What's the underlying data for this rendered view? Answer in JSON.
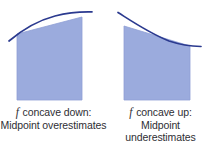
{
  "figure": {
    "background_color": "#ffffff",
    "fill_color": "#9babdd",
    "fill_edge_color": "#8fa0d6",
    "curve_color": "#2b3a8f",
    "text_color": "#2e2e33",
    "panels": [
      {
        "id": "concave-down",
        "caption_symbol": "f",
        "caption_line1": "concave down:",
        "caption_line2": "Midpoint overestimates",
        "rectangle": {
          "left": 17,
          "right": 82,
          "bottom": 100,
          "top_left_y": 34,
          "top_right_y": 17
        },
        "curve_description": "concave-down increasing curve tangent to slanted top edge at midpoint",
        "curve_points": [
          [
            10,
            40
          ],
          [
            20,
            33
          ],
          [
            30,
            27
          ],
          [
            40,
            22
          ],
          [
            50,
            18
          ],
          [
            60,
            15
          ],
          [
            70,
            13
          ],
          [
            80,
            12
          ],
          [
            90,
            12
          ]
        ]
      },
      {
        "id": "concave-up",
        "caption_symbol": "f",
        "caption_line1": "concave up:",
        "caption_line2": "Midpoint underestimates",
        "rectangle": {
          "left": 17,
          "right": 83,
          "bottom": 100,
          "top_left_y": 26,
          "top_right_y": 46
        },
        "curve_description": "concave-up decreasing curve tangent to slanted top edge at midpoint",
        "curve_points": [
          [
            11,
            13
          ],
          [
            20,
            19
          ],
          [
            30,
            26
          ],
          [
            40,
            32
          ],
          [
            50,
            37
          ],
          [
            60,
            41
          ],
          [
            70,
            44
          ],
          [
            80,
            45
          ],
          [
            92,
            46
          ]
        ]
      }
    ]
  }
}
